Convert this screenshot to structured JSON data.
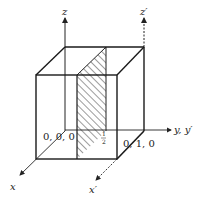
{
  "diagram": {
    "type": "unit-cell-with-plane",
    "axes": {
      "z": "z",
      "z_prime": "z′",
      "y": "y, y′",
      "x": "x",
      "x_prime": "x′"
    },
    "points": {
      "origin": "0, 0, 0",
      "y_unit": "0, 1, 0"
    },
    "plane_label": {
      "numerator": "1",
      "denominator": "2"
    },
    "colors": {
      "stroke": "#1a1a1a",
      "background": "#ffffff"
    }
  }
}
